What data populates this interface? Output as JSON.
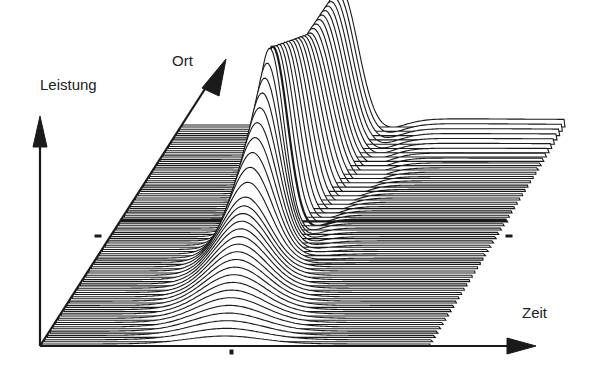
{
  "diagram": {
    "type": "waterfall-plot",
    "axes": {
      "power_label": "Leistung",
      "position_label": "Ort",
      "time_label": "Zeit"
    },
    "colors": {
      "line": "#1a1a1a",
      "background": "#ffffff",
      "axis": "#1a1a1a"
    },
    "rows": 52
  }
}
